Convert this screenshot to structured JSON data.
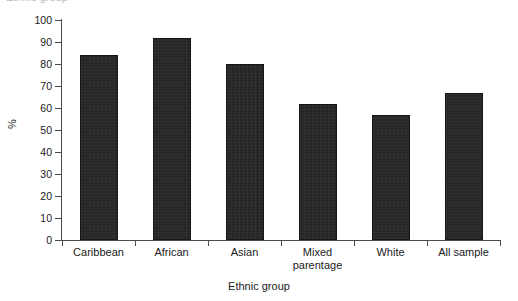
{
  "figure": {
    "cropped_header_text": "Ethnic group",
    "background_color": "#ffffff",
    "bar_color": "#262626",
    "axis_color": "#4a4a4a"
  },
  "chart_data": {
    "type": "bar",
    "title": "",
    "xlabel": "Ethnic group",
    "ylabel": "%",
    "categories": [
      "Caribbean",
      "African",
      "Asian",
      "Mixed parentage",
      "White",
      "All sample"
    ],
    "values": [
      84,
      92,
      80,
      62,
      57,
      67
    ],
    "ylim": [
      0,
      100
    ],
    "yticks": [
      0,
      10,
      20,
      30,
      40,
      50,
      60,
      70,
      80,
      90,
      100
    ],
    "ytick_labels": [
      "0",
      "10",
      "20",
      "30",
      "40",
      "50",
      "60",
      "70",
      "80",
      "90",
      "100"
    ],
    "grid": false,
    "legend": null,
    "legend_position": "none",
    "series": [
      {
        "name": "%",
        "values": [
          84,
          92,
          80,
          62,
          57,
          67
        ]
      }
    ],
    "category_label_lines": [
      [
        "Caribbean"
      ],
      [
        "African"
      ],
      [
        "Asian"
      ],
      [
        "Mixed",
        "parentage"
      ],
      [
        "White"
      ],
      [
        "All sample"
      ]
    ]
  }
}
